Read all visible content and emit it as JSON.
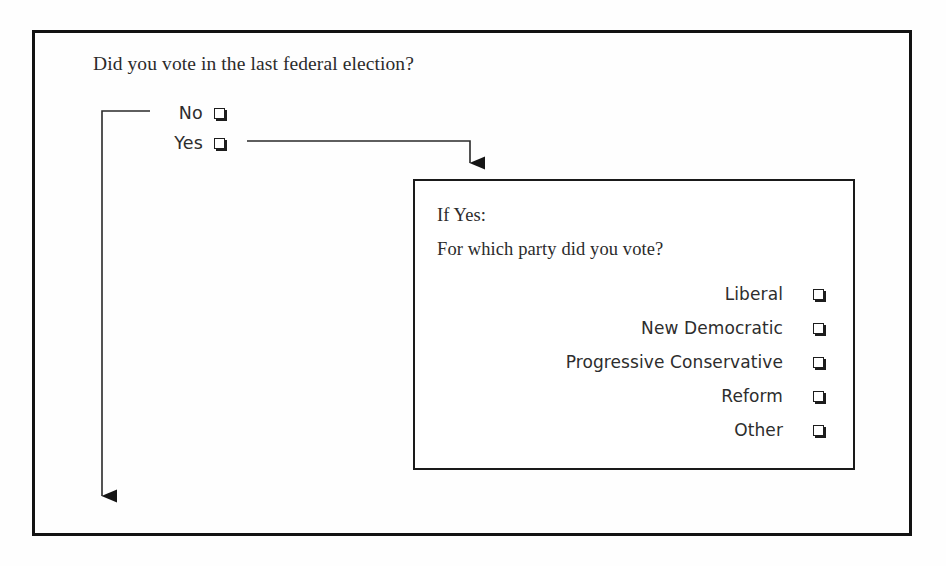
{
  "diagram": {
    "type": "survey-skip-logic-flow",
    "main_question": "Did you vote in the last federal election?",
    "answers": [
      {
        "label": "No",
        "checkbox": "empty-checkbox"
      },
      {
        "label": "Yes",
        "checkbox": "empty-checkbox"
      }
    ],
    "branch_box": {
      "condition_label": "If Yes:",
      "question": "For which party did you vote?",
      "options": [
        {
          "label": "Liberal",
          "checkbox": "empty-checkbox"
        },
        {
          "label": "New Democratic",
          "checkbox": "empty-checkbox"
        },
        {
          "label": "Progressive Conservative",
          "checkbox": "empty-checkbox"
        },
        {
          "label": "Reform",
          "checkbox": "empty-checkbox"
        },
        {
          "label": "Other",
          "checkbox": "empty-checkbox"
        }
      ]
    },
    "connectors": [
      {
        "name": "no-skip-connector",
        "from": "No",
        "to": "end-of-section",
        "arrowhead": "down"
      },
      {
        "name": "yes-branch-connector",
        "from": "Yes",
        "to": "If Yes box",
        "arrowhead": "down"
      }
    ],
    "colors": {
      "ink": "#2b2b2b",
      "line": "#1a1a1a",
      "frame": "#121212",
      "background": "#fefefe",
      "checkbox_shadow": "#1d1d1d"
    }
  }
}
